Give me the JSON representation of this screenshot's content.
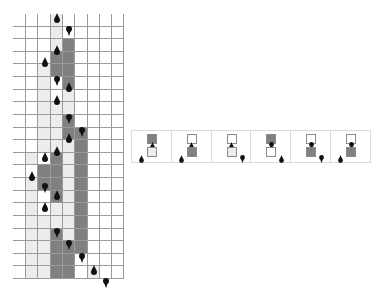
{
  "colors": {
    "white": "#ffffff",
    "light": "#ececec",
    "dark": "#808080",
    "marker": "#111111",
    "gridline": "#9a9a9a"
  },
  "grid": {
    "cols": 9,
    "rows": 21,
    "origin": [
      13,
      14
    ],
    "col_edges": [
      0,
      13,
      25,
      38,
      50,
      62,
      75,
      87,
      99,
      111
    ],
    "row_height": 12.62,
    "cells": [
      "WWWLWWWWW",
      "WWWLWWWWW",
      "WWWLDWWWW",
      "WWWDDWWWW",
      "WWLDDWWWW",
      "WWLWDWWWW",
      "WWLWLWWWW",
      "WWLLLWWWW",
      "WWLLDWWWW",
      "WWLLDDWWW",
      "WWLLLDWWW",
      "WLWDLDWWW",
      "WWDDLDWWW",
      "WLDDLDWWW",
      "WLWDLDWWW",
      "WLWLLDWWW",
      "WLLLLDWWW",
      "WLLDLDWWW",
      "WLLDDDWWW",
      "WLLDDWWWW",
      "WLLDDWLWW"
    ],
    "markers": [
      {
        "row": 0,
        "col": 3,
        "type": "drop",
        "pos": "top"
      },
      {
        "row": 1,
        "col": 4,
        "type": "pin",
        "pos": "top"
      },
      {
        "row": 2,
        "col": 3,
        "type": "drop",
        "pos": "mid"
      },
      {
        "row": 3,
        "col": 2,
        "type": "drop",
        "pos": "mid"
      },
      {
        "row": 4,
        "col": 3,
        "type": "pin",
        "pos": "bottom"
      },
      {
        "row": 5,
        "col": 4,
        "type": "drop",
        "pos": "mid"
      },
      {
        "row": 6,
        "col": 3,
        "type": "drop",
        "pos": "mid"
      },
      {
        "row": 8,
        "col": 4,
        "type": "pin",
        "pos": "top"
      },
      {
        "row": 9,
        "col": 5,
        "type": "pin",
        "pos": "top"
      },
      {
        "row": 9,
        "col": 4,
        "type": "drop",
        "pos": "mid"
      },
      {
        "row": 10,
        "col": 3,
        "type": "drop",
        "pos": "mid"
      },
      {
        "row": 11,
        "col": 2,
        "type": "drop",
        "pos": "top"
      },
      {
        "row": 12,
        "col": 1,
        "type": "drop",
        "pos": "mid"
      },
      {
        "row": 13,
        "col": 2,
        "type": "pin",
        "pos": "mid"
      },
      {
        "row": 14,
        "col": 3,
        "type": "drop",
        "pos": "top"
      },
      {
        "row": 15,
        "col": 2,
        "type": "drop",
        "pos": "top"
      },
      {
        "row": 17,
        "col": 3,
        "type": "pin",
        "pos": "top"
      },
      {
        "row": 18,
        "col": 4,
        "type": "pin",
        "pos": "top"
      },
      {
        "row": 19,
        "col": 5,
        "type": "pin",
        "pos": "top"
      },
      {
        "row": 20,
        "col": 6,
        "type": "drop",
        "pos": "top"
      },
      {
        "row": 21,
        "col": 7,
        "type": "pin",
        "pos": "top"
      }
    ]
  },
  "legend": {
    "panels": [
      {
        "top": "dark",
        "top_marker": "drop",
        "bottom": "light",
        "side_marker": "drop",
        "side": "left"
      },
      {
        "top": "white",
        "top_marker": "drop",
        "bottom": "dark",
        "side_marker": "drop",
        "side": "left"
      },
      {
        "top": "white",
        "top_marker": "drop",
        "bottom": "light",
        "side_marker": "pin",
        "side": "right"
      },
      {
        "top": "dark",
        "top_marker": "pin",
        "bottom": "white",
        "side_marker": "drop",
        "side": "right"
      },
      {
        "top": "white",
        "top_marker": "pin",
        "bottom": "dark",
        "side_marker": "pin",
        "side": "right"
      },
      {
        "top": "white",
        "top_marker": "pin",
        "bottom": "dark",
        "side_marker": "drop",
        "side": "left"
      }
    ]
  }
}
